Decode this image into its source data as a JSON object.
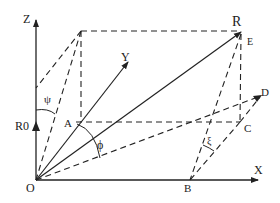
{
  "diagram": {
    "title": "",
    "labels": {
      "z_axis": "Z",
      "x_axis": "X",
      "y_axis": "Y",
      "origin": "O",
      "r0": "R0",
      "r": "R",
      "a": "A",
      "b": "B",
      "c": "C",
      "d": "D",
      "e": "E",
      "psi": "ψ",
      "phi": "ϕ",
      "xi": "ξ"
    },
    "colors": {
      "line": "#222222",
      "background": "#ffffff"
    },
    "points": {
      "O": [
        36,
        180
      ],
      "Z_tip": [
        36,
        20
      ],
      "X_tip": [
        258,
        180
      ],
      "Y_tip": [
        128,
        62
      ],
      "R": [
        241,
        32
      ],
      "A": [
        76,
        122
      ],
      "B": [
        190,
        180
      ],
      "C": [
        240,
        122
      ],
      "D": [
        262,
        95
      ],
      "top_corner": [
        81,
        31
      ]
    }
  }
}
